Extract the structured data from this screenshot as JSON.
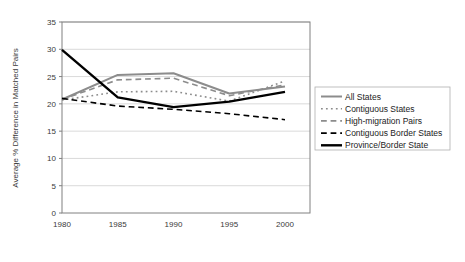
{
  "chart_data": {
    "type": "line",
    "title": "",
    "xlabel": "",
    "ylabel": "Average % Difference in Matched Pairs",
    "x": [
      1980,
      1985,
      1990,
      1995,
      2000
    ],
    "xtick_labels": [
      "1980",
      "1985",
      "1990",
      "1995",
      "2000"
    ],
    "ytick_labels": [
      "0",
      "5",
      "10",
      "15",
      "20",
      "25",
      "30",
      "35"
    ],
    "yticks": [
      0,
      5,
      10,
      15,
      20,
      25,
      30,
      35
    ],
    "ylim": [
      0,
      35
    ],
    "xlim": [
      1980,
      2000
    ],
    "grid": "horizontal",
    "legend_position": "right",
    "series": [
      {
        "name": "All States",
        "values": [
          20.8,
          25.3,
          25.6,
          21.9,
          23.2
        ],
        "color": "#8c8c8c",
        "style": "solid",
        "width": 2.0
      },
      {
        "name": "Contiguous States",
        "values": [
          20.7,
          22.2,
          22.3,
          20.5,
          24.2
        ],
        "color": "#8c8c8c",
        "style": "dotted",
        "width": 1.6
      },
      {
        "name": "High-migration Pairs",
        "values": [
          20.8,
          24.4,
          24.7,
          21.5,
          23.5
        ],
        "color": "#8c8c8c",
        "style": "dashed",
        "width": 1.6
      },
      {
        "name": "Contiguous Border States",
        "values": [
          21.0,
          19.6,
          19.0,
          18.2,
          17.1
        ],
        "color": "#000000",
        "style": "dashed",
        "width": 1.6
      },
      {
        "name": "Province/Border State",
        "values": [
          29.9,
          21.2,
          19.4,
          20.4,
          22.2
        ],
        "color": "#000000",
        "style": "solid",
        "width": 2.4
      }
    ]
  },
  "axis": {
    "y_title": "Average % Difference in Matched Pairs"
  },
  "colors": {
    "gray_series": "#8c8c8c",
    "black_series": "#000000",
    "gridline": "#c8c8c8",
    "axis_line": "#808080",
    "legend_border": "#b0b0b0",
    "background": "#ffffff"
  }
}
